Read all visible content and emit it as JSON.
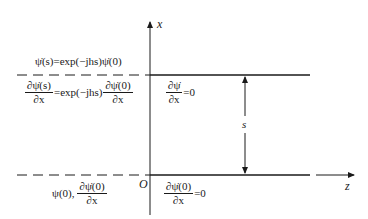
{
  "diagram": {
    "axes": {
      "x_label": "x",
      "z_label": "z",
      "origin_label": "O"
    },
    "dimension_label": "s",
    "top_left": {
      "eq1": "ψ̇(s)=exp(−jhs)ψ̇(0)",
      "eq2_num_left": "∂ψ̇(s)",
      "eq2_den_left": "∂x",
      "eq2_mid": "=exp(−jhs)",
      "eq2_num_right": "∂ψ̇(0)",
      "eq2_den_right": "∂x"
    },
    "top_right": {
      "num": "∂ψ̇",
      "den": "∂x",
      "rhs": "=0"
    },
    "bottom_left": {
      "prefix": "ψ(0),",
      "num": "∂ψ̇(0)",
      "den": "∂x"
    },
    "bottom_right": {
      "num": "∂ψ̇(0)",
      "den": "∂x",
      "rhs": "=0"
    },
    "colors": {
      "line": "#1a1a1a",
      "background": "#ffffff"
    }
  }
}
